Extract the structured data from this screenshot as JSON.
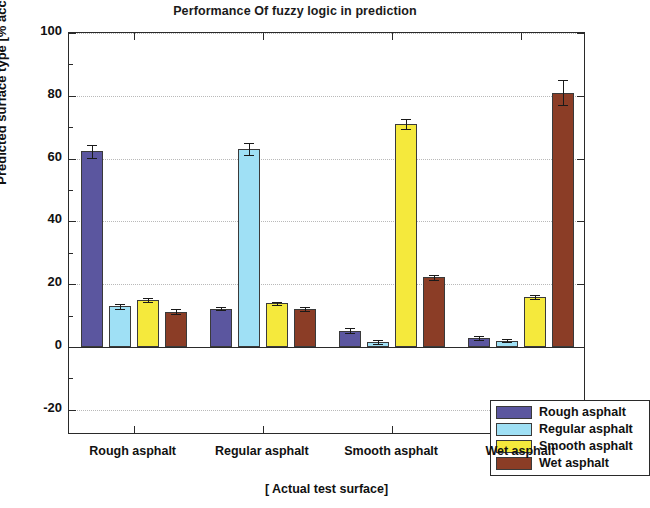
{
  "chart_data": {
    "type": "bar",
    "title": "Performance Of fuzzy logic  in prediction",
    "xlabel": "[ Actual test surface]",
    "ylabel": "Predicted surface type [% accuracy]",
    "categories": [
      "Rough asphalt",
      "Regular asphalt",
      "Smooth asphalt",
      "Wet asphalt"
    ],
    "ylim": [
      -28,
      100
    ],
    "yticks": [
      100,
      80,
      60,
      40,
      20,
      0,
      -20
    ],
    "ytick_labels": [
      "100",
      "80",
      "60",
      "40",
      "20",
      "0",
      "-20"
    ],
    "grid": true,
    "grid_axis": "y",
    "legend_position": "lower right inside axes",
    "series": [
      {
        "name": "Rough asphalt",
        "color": "#5b569f",
        "values": [
          62.3,
          12.2,
          5.2,
          3.0
        ],
        "errors": [
          2.0,
          0.5,
          0.8,
          0.6
        ]
      },
      {
        "name": "Regular asphalt",
        "color": "#9fe0f5",
        "values": [
          13.0,
          63.0,
          1.6,
          2.0
        ],
        "errors": [
          0.8,
          2.0,
          0.5,
          0.5
        ]
      },
      {
        "name": "Smooth asphalt",
        "color": "#f5e93c",
        "values": [
          15.0,
          14.0,
          71.0,
          16.0
        ],
        "errors": [
          0.6,
          0.5,
          1.5,
          0.6
        ]
      },
      {
        "name": "Wet asphalt",
        "color": "#8b3d26",
        "values": [
          11.3,
          12.2,
          22.2,
          81.0
        ],
        "errors": [
          0.7,
          0.6,
          0.8,
          4.0
        ]
      }
    ]
  },
  "legend": {
    "entries": [
      {
        "label": "Rough asphalt",
        "color": "#5b569f"
      },
      {
        "label": "Regular asphalt",
        "color": "#9fe0f5"
      },
      {
        "label": "Smooth asphalt",
        "color": "#f5e93c"
      },
      {
        "label": "Wet asphalt",
        "color": "#8b3d26"
      }
    ]
  }
}
